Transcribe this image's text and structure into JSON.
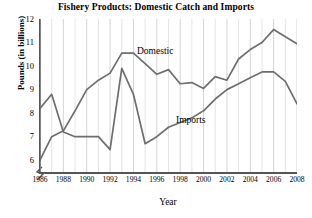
{
  "chart_data": {
    "type": "line",
    "title": "Fishery Products: Domestic Catch and Imports",
    "xlabel": "Year",
    "ylabel": "Pounds (in billions)",
    "xlim": [
      1986,
      2008
    ],
    "ylim": [
      5.5,
      12
    ],
    "grid": "vertical",
    "axis_break": true,
    "legend_position": "inline-labels",
    "ytick_labels": [
      "12",
      "11",
      "10",
      "9",
      "8",
      "7",
      "6"
    ],
    "ytick_values": [
      12,
      11,
      10,
      9,
      8,
      7,
      6
    ],
    "xtick_labels": [
      "1986",
      "1988",
      "1990",
      "1992",
      "1994",
      "1996",
      "1998",
      "2000",
      "2002",
      "2004",
      "2006",
      "2008"
    ],
    "xtick_values": [
      1986,
      1988,
      1990,
      1992,
      1994,
      1996,
      1998,
      2000,
      2002,
      2004,
      2006,
      2008
    ],
    "x": [
      1986,
      1987,
      1988,
      1989,
      1990,
      1991,
      1992,
      1993,
      1994,
      1995,
      1996,
      1997,
      1998,
      1999,
      2000,
      2001,
      2002,
      2003,
      2004,
      2005,
      2006,
      2007,
      2008
    ],
    "series": [
      {
        "name": "Domestic",
        "color": "#6e6e6e",
        "values": [
          8.2,
          8.8,
          7.2,
          7.0,
          7.0,
          7.0,
          6.45,
          9.9,
          8.8,
          6.7,
          7.0,
          7.4,
          7.6,
          7.8,
          8.1,
          8.6,
          9.0,
          9.25,
          9.5,
          9.75,
          9.75,
          9.35,
          8.4
        ]
      },
      {
        "name": "Imports",
        "color": "#6e6e6e",
        "values": [
          6.0,
          7.0,
          7.25,
          8.1,
          9.0,
          9.4,
          9.7,
          10.55,
          10.55,
          10.1,
          9.65,
          9.85,
          9.25,
          9.3,
          9.05,
          9.55,
          9.4,
          10.3,
          10.7,
          11.0,
          11.55,
          11.25,
          10.95
        ]
      }
    ],
    "annotations": [
      {
        "text": "Domestic",
        "near_series": "Imports"
      },
      {
        "text": "Imports",
        "near_series": "Domestic"
      }
    ]
  }
}
